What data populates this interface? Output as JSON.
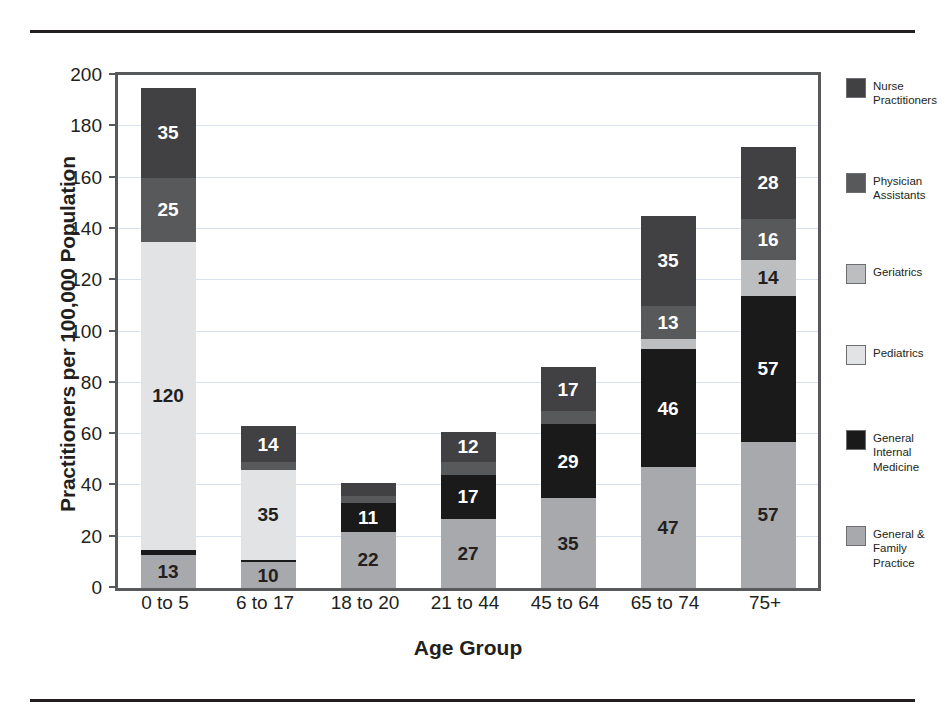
{
  "chart_data": {
    "type": "bar",
    "subtype": "stacked-bar",
    "title": "",
    "xlabel": "Age Group",
    "ylabel": "Practitioners per 100,000 Population",
    "ylim": [
      0,
      200
    ],
    "ytick_step": 20,
    "yticks": [
      0,
      20,
      40,
      60,
      80,
      100,
      120,
      140,
      160,
      180,
      200
    ],
    "ytick_labels": [
      "0",
      "20",
      "40",
      "60",
      "80",
      "100",
      "120",
      "140",
      "160",
      "180",
      "200"
    ],
    "grid": true,
    "legend_position": "right",
    "categories": [
      "0 to 5",
      "6 to 17",
      "18 to 20",
      "21 to 44",
      "45 to 64",
      "65 to 74",
      "75+"
    ],
    "series": [
      {
        "name": "General & Family Practice",
        "color": "#a7a9ac",
        "values": [
          13,
          10,
          22,
          27,
          35,
          47,
          57
        ],
        "labels": [
          "13",
          "10",
          "22",
          "27",
          "35",
          "47",
          "57"
        ],
        "label_color": "#231f20"
      },
      {
        "name": "General Internal Medicine",
        "color": "#1a1a1a",
        "values": [
          2,
          1,
          11,
          17,
          29,
          46,
          57
        ],
        "labels": [
          "",
          "",
          "11",
          "17",
          "29",
          "46",
          "57"
        ],
        "label_color": "#ffffff"
      },
      {
        "name": "Pediatrics",
        "color": "#e2e3e4",
        "values": [
          120,
          35,
          0,
          0,
          0,
          0,
          0
        ],
        "labels": [
          "120",
          "35",
          "",
          "",
          "",
          "",
          ""
        ],
        "label_color": "#231f20"
      },
      {
        "name": "Geriatrics",
        "color": "#bcbec0",
        "values": [
          0,
          0,
          0,
          0,
          0,
          4,
          14
        ],
        "labels": [
          "",
          "",
          "",
          "",
          "",
          "",
          "14"
        ],
        "label_color": "#231f20"
      },
      {
        "name": "Physician Assistants",
        "color": "#58595b",
        "values": [
          25,
          3,
          3,
          5,
          5,
          13,
          16
        ],
        "labels": [
          "25",
          "",
          "",
          "",
          "",
          "13",
          "16"
        ],
        "label_color": "#ffffff"
      },
      {
        "name": "Nurse Practitioners",
        "color": "#414042",
        "values": [
          35,
          14,
          5,
          12,
          17,
          35,
          28
        ],
        "labels": [
          "35",
          "14",
          "",
          "12",
          "17",
          "35",
          "28"
        ],
        "label_color": "#ffffff"
      }
    ],
    "totals": [
      195,
      63,
      41,
      61,
      86,
      145,
      172
    ],
    "legend_order": [
      "Nurse Practitioners",
      "Physician Assistants",
      "Geriatrics",
      "Pediatrics",
      "General Internal Medicine",
      "General & Family Practice"
    ]
  },
  "legend": {
    "items": [
      {
        "label": "Nurse\nPractitioners",
        "color": "#414042",
        "top": 0
      },
      {
        "label": "Physician\nAssistants",
        "color": "#58595b",
        "top": 95
      },
      {
        "label": "Geriatrics",
        "color": "#bcbec0",
        "top": 186
      },
      {
        "label": "Pediatrics",
        "color": "#e2e3e4",
        "top": 267
      },
      {
        "label": "General\nInternal\nMedicine",
        "color": "#1a1a1a",
        "top": 352
      },
      {
        "label": "General &\nFamily\nPractice",
        "color": "#a7a9ac",
        "top": 448
      }
    ]
  },
  "axes": {
    "y_title": "Practitioners per 100,000 Population",
    "x_title": "Age Group"
  }
}
